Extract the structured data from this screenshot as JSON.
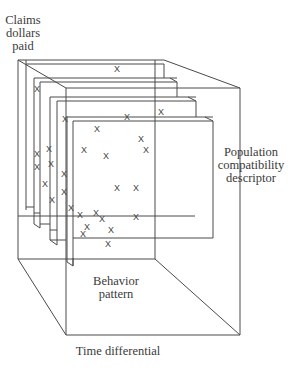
{
  "diagram": {
    "type": "3d-cube-of-stacked-planes",
    "labels": {
      "y_axis": [
        "Claims",
        "dollars",
        "paid"
      ],
      "z_axis": [
        "Population",
        "compatibility",
        "descriptor"
      ],
      "x_axis": "Time differential",
      "floor": [
        "Behavior",
        "pattern"
      ]
    },
    "marker_glyph": "X",
    "stroke_color": "#4a4a4a",
    "plane_count": 4
  }
}
